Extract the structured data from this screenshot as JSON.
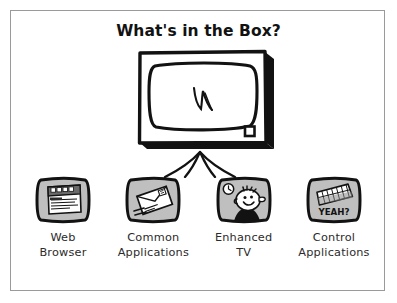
{
  "figure": {
    "title": "What's in the Box?",
    "background_color": "#ffffff",
    "border_color": "#9a9a9a",
    "ink_color": "#121212",
    "screen_fill_color": "#bfbfbf"
  },
  "central": {
    "name": "television-set",
    "screen_doodle": "squiggle",
    "indicator_light": "small-square-button"
  },
  "arrow": {
    "name": "converging-up-arrow",
    "direction": "up"
  },
  "items": [
    {
      "label": "Web\nBrowser",
      "icon": "browser-window-icon",
      "screen_content": "browser window with title bar buttons and text lines"
    },
    {
      "label": "Common\nApplications",
      "icon": "envelope-icon",
      "screen_content": "tilted envelope with stamp and motion lines"
    },
    {
      "label": "Enhanced\nTV",
      "icon": "cartoon-face-icon",
      "screen_content": "cartoon face with clock badge"
    },
    {
      "label": "Control\nApplications",
      "icon": "keyboard-icon",
      "screen_content": "keyboard with caption YEAH?",
      "caption": "YEAH?"
    }
  ]
}
